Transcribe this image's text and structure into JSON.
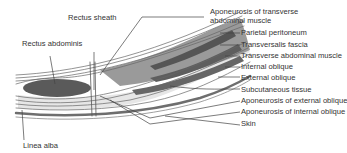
{
  "diagram": {
    "type": "anatomical-cross-section",
    "colors": {
      "line": "#555555",
      "muscle_dark": "#5a5a5a",
      "muscle_mid": "#8a8a8a",
      "fascia_light": "#e2e2e2",
      "skin_band": "#6e6e6e",
      "text": "#333333"
    },
    "left_labels": {
      "rectus_sheath": "Rectus sheath",
      "rectus_abdominis": "Rectus abdominis",
      "linea_alba": "Linea alba"
    },
    "right_labels": [
      {
        "id": "aponeurosis_transverse_line1",
        "text": "Aponeurosis of transverse"
      },
      {
        "id": "aponeurosis_transverse_line2",
        "text": "abdominal muscle"
      },
      {
        "id": "parietal_peritoneum",
        "text": "Parietal peritoneum"
      },
      {
        "id": "transversalis_fascia",
        "text": "Transversalis fascia"
      },
      {
        "id": "transverse_abdominal_muscle",
        "text": "Transverse abdominal muscle"
      },
      {
        "id": "internal_oblique",
        "text": "Internal oblique"
      },
      {
        "id": "external_oblique",
        "text": "External oblique"
      },
      {
        "id": "subcutaneous_tissue",
        "text": "Subcutaneous tissue"
      },
      {
        "id": "aponeurosis_external_oblique",
        "text": "Aponeurosis of external oblique"
      },
      {
        "id": "aponeurosis_internal_oblique",
        "text": "Aponeurosis of internal oblique"
      },
      {
        "id": "skin",
        "text": "Skin"
      }
    ]
  }
}
